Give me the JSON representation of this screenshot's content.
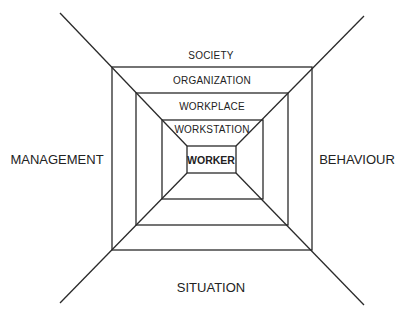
{
  "diagram": {
    "layers": [
      {
        "label": "SOCIETY",
        "x": 211,
        "y": 55
      },
      {
        "label": "ORGANIZATION",
        "x": 212,
        "y": 80
      },
      {
        "label": "WORKPLACE",
        "x": 212,
        "y": 106
      },
      {
        "label": "WORKSTATION",
        "x": 212,
        "y": 129
      },
      {
        "label": "WORKER",
        "x": 211,
        "y": 160
      }
    ],
    "sides": {
      "left": "MANAGEMENT",
      "right": "BEHAVIOUR",
      "bottom": "SITUATION"
    },
    "colors": {
      "line": "#2a2a2a",
      "text": "#222222",
      "background": "#ffffff"
    }
  }
}
